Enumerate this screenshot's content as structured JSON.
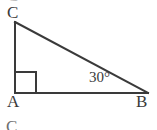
{
  "figure": {
    "type": "right-triangle-diagram",
    "stroke_color": "#3a3a3a",
    "background_color": "#ffffff",
    "vertices": {
      "A": {
        "x": 15,
        "y": 93,
        "label": "A"
      },
      "B": {
        "x": 148,
        "y": 93,
        "label": "B"
      },
      "C": {
        "x": 15,
        "y": 22,
        "label": "C"
      }
    },
    "angle_marks": [
      {
        "at": "A",
        "type": "right-angle-square",
        "size": 20
      },
      {
        "at": "B",
        "type": "angle-label",
        "label": "30°"
      }
    ],
    "edges": [
      {
        "from": "A",
        "to": "C",
        "name": "leg-AC"
      },
      {
        "from": "A",
        "to": "B",
        "name": "leg-AB"
      },
      {
        "from": "C",
        "to": "B",
        "name": "hypotenuse-CB"
      }
    ]
  },
  "labels": {
    "vertex_c": "C",
    "vertex_a": "A",
    "vertex_b": "B",
    "angle_b": "30°",
    "cropped_glyph_bottom": "C",
    "cropped_glyph_top": "C"
  }
}
